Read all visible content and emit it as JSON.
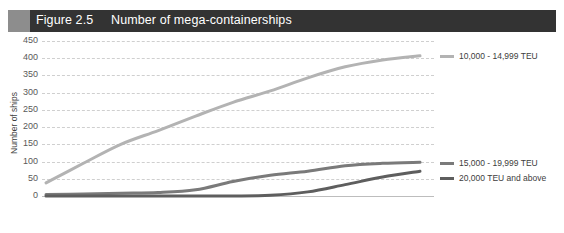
{
  "header": {
    "figure_number": "Figure 2.5",
    "title": "Number of mega-containerships",
    "band_color": "#333333",
    "accent_block_color": "#8d8d8d"
  },
  "chart_data": {
    "type": "line",
    "title": "Number of mega-containerships",
    "xlabel": "",
    "ylabel": "Number of ships",
    "categories": [
      "2011",
      "2012",
      "2013",
      "2014",
      "2015",
      "2016",
      "2017",
      "2018",
      "2019",
      "2020",
      "2021"
    ],
    "ylim": [
      0,
      450
    ],
    "ytick_labels": [
      "450",
      "400",
      "350",
      "300",
      "250",
      "200",
      "150",
      "100",
      "50",
      "0"
    ],
    "ytick_values": [
      450,
      400,
      350,
      300,
      250,
      200,
      150,
      100,
      50,
      0
    ],
    "grid": "horizontal-dashed",
    "legend_position": "right",
    "series": [
      {
        "name": "10,000 - 14,999 TEU",
        "color": "#b3b3b3",
        "values": [
          38,
          95,
          150,
          190,
          232,
          272,
          305,
          343,
          375,
          395,
          407
        ]
      },
      {
        "name": "15,000 - 19,999 TEU",
        "color": "#7a7a7a",
        "values": [
          4,
          6,
          8,
          10,
          18,
          42,
          60,
          72,
          88,
          95,
          98
        ]
      },
      {
        "name": "20,000 TEU and above",
        "color": "#5e5e5e",
        "values": [
          0,
          0,
          0,
          0,
          0,
          0,
          2,
          12,
          33,
          55,
          72
        ]
      }
    ]
  },
  "legend": {
    "items": [
      {
        "label": "10,000 - 14,999 TEU",
        "color": "#b3b3b3"
      },
      {
        "label": "15,000 - 19,999 TEU",
        "color": "#7a7a7a"
      },
      {
        "label": "20,000 TEU and above",
        "color": "#5e5e5e"
      }
    ]
  }
}
